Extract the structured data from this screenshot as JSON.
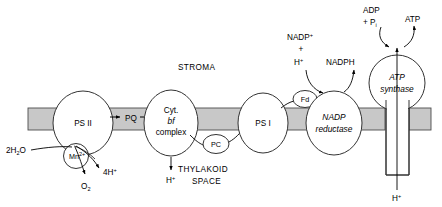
{
  "figure": {
    "colors": {
      "membrane_fill": "#c8c8c8",
      "membrane_stroke": "#4d4d4d",
      "organelle_fill": "#ffffff",
      "organelle_stroke": "#333333",
      "line": "#000000",
      "background": "#ffffff"
    }
  },
  "compartments": {
    "stroma": "STROMA",
    "thylakoid_line1": "THYLAKOID",
    "thylakoid_line2": "SPACE"
  },
  "complexes": {
    "ps2": "PS II",
    "cytbf_line1": "Cyt.",
    "cytbf_line2": "bf",
    "cytbf_line3": "complex",
    "ps1": "PS I",
    "nadp_reductase_line1": "NADP",
    "nadp_reductase_line2": "reductase",
    "atp_synthase_line1": "ATP",
    "atp_synthase_line2": "synthase"
  },
  "carriers": {
    "pq": "PQ",
    "pc": "PC",
    "fd": "Fd",
    "mn": "Mn",
    "mn_charge": "2+"
  },
  "substrates": {
    "water": "2H",
    "water_sub": "2",
    "water_end": "O",
    "oxygen": "O",
    "oxygen_sub": "2",
    "protons_out": "4H",
    "protons_out_sup": "+",
    "proton_lumen": "H",
    "proton_lumen_sup": "+",
    "proton_bottom": "H",
    "proton_bottom_sup": "+",
    "nadp_plus": "NADP",
    "nadp_plus_sup": "+",
    "plus_sign": "+",
    "h_plus_stroma": "H",
    "h_plus_stroma_sup": "+",
    "nadph": "NADPH",
    "adp": "ADP",
    "phosphate_prefix": "+ P",
    "phosphate_sub": "i",
    "atp": "ATP"
  }
}
